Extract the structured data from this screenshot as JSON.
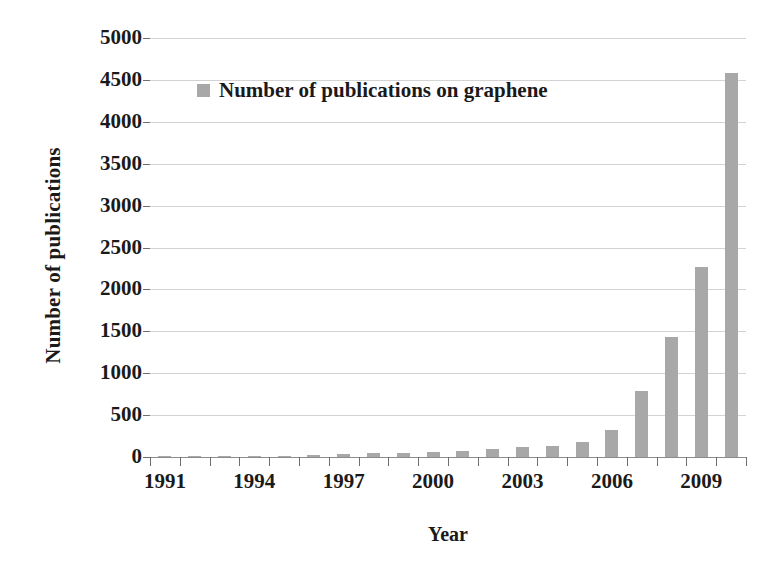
{
  "chart_data": {
    "type": "bar",
    "title": "",
    "xlabel": "Year",
    "ylabel": "Number of publications",
    "legend": [
      "Number of publications on graphene"
    ],
    "legend_position": "inside-top-left",
    "grid": true,
    "bar_color": "#a8a8a8",
    "ylim": [
      0,
      5000
    ],
    "ytick_step": 500,
    "ytick_labels": [
      "5000",
      "4500",
      "4000",
      "3500",
      "3000",
      "2500",
      "2000",
      "1500",
      "1000",
      "500",
      "0"
    ],
    "ytick_values": [
      5000,
      4500,
      4000,
      3500,
      3000,
      2500,
      2000,
      1500,
      1000,
      500,
      0
    ],
    "xtick_labels": [
      "1991",
      "1994",
      "1997",
      "2000",
      "2003",
      "2006",
      "2009"
    ],
    "xtick_values": [
      1991,
      1994,
      1997,
      2000,
      2003,
      2006,
      2009
    ],
    "categories": [
      "1991",
      "1992",
      "1993",
      "1994",
      "1995",
      "1996",
      "1997",
      "1998",
      "1999",
      "1990",
      "2001",
      "2002",
      "2003",
      "2004",
      "2005",
      "2006",
      "2007",
      "2008",
      "2009",
      "2010"
    ],
    "x": [
      1991,
      1992,
      1993,
      1994,
      1995,
      1996,
      1997,
      1998,
      1999,
      2000,
      2001,
      2002,
      2003,
      2004,
      2005,
      2006,
      2007,
      2008,
      2009,
      2010
    ],
    "values": [
      2,
      4,
      8,
      12,
      18,
      25,
      38,
      45,
      52,
      60,
      72,
      95,
      120,
      135,
      180,
      320,
      790,
      1430,
      2270,
      4580
    ],
    "series": [
      {
        "name": "Number of publications on graphene",
        "values": [
          2,
          4,
          8,
          12,
          18,
          25,
          38,
          45,
          52,
          60,
          72,
          95,
          120,
          135,
          180,
          320,
          790,
          1430,
          2270,
          4580
        ]
      }
    ]
  },
  "axes": {
    "y_title": "Number of publications",
    "x_title": "Year"
  },
  "legend": {
    "label": "Number of publications on graphene"
  }
}
